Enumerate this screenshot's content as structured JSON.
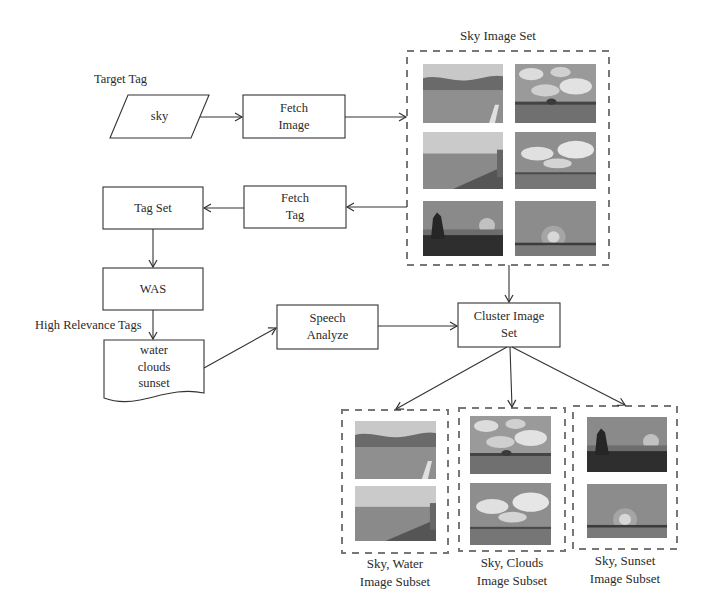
{
  "labels": {
    "target_tag": "Target Tag",
    "sky_image_set": "Sky Image Set",
    "high_relevance_tags": "High Relevance Tags"
  },
  "nodes": {
    "sky_input": {
      "text": "sky",
      "shape": "parallelogram"
    },
    "fetch_image": {
      "line1": "Fetch",
      "line2": "Image",
      "shape": "rectangle"
    },
    "fetch_tag": {
      "line1": "Fetch",
      "line2": "Tag",
      "shape": "rectangle"
    },
    "tag_set": {
      "text": "Tag Set",
      "shape": "rectangle"
    },
    "was": {
      "text": "WAS",
      "shape": "rectangle"
    },
    "tags_document": {
      "lines": [
        "water",
        "clouds",
        "sunset"
      ],
      "shape": "document"
    },
    "speech_analyze": {
      "line1": "Speech",
      "line2": "Analyze",
      "shape": "rectangle"
    },
    "cluster_image_set": {
      "line1": "Cluster Image",
      "line2": "Set",
      "shape": "rectangle"
    }
  },
  "image_sets": {
    "sky": {
      "images": [
        "lake-hills",
        "clouds-tree",
        "water-shore",
        "cumulus-field",
        "sunset-tree",
        "sunset-sun"
      ]
    }
  },
  "subsets": [
    {
      "id": "water",
      "line1": "Sky, Water",
      "line2": "Image Subset",
      "images": [
        "lake-hills",
        "water-shore"
      ]
    },
    {
      "id": "clouds",
      "line1": "Sky, Clouds",
      "line2": "Image Subset",
      "images": [
        "clouds-tree",
        "cumulus-field"
      ]
    },
    {
      "id": "sunset",
      "line1": "Sky, Sunset",
      "line2": "Image Subset",
      "images": [
        "sunset-tree",
        "sunset-sun"
      ]
    }
  ],
  "edges": [
    {
      "from": "sky_input",
      "to": "fetch_image"
    },
    {
      "from": "fetch_image",
      "to": "sky_image_set"
    },
    {
      "from": "sky_image_set",
      "to": "fetch_tag"
    },
    {
      "from": "fetch_tag",
      "to": "tag_set"
    },
    {
      "from": "tag_set",
      "to": "was"
    },
    {
      "from": "was",
      "to": "tags_document",
      "label": "High Relevance Tags"
    },
    {
      "from": "tags_document",
      "to": "speech_analyze"
    },
    {
      "from": "speech_analyze",
      "to": "cluster_image_set"
    },
    {
      "from": "sky_image_set",
      "to": "cluster_image_set"
    },
    {
      "from": "cluster_image_set",
      "to": "water_subset"
    },
    {
      "from": "cluster_image_set",
      "to": "clouds_subset"
    },
    {
      "from": "cluster_image_set",
      "to": "sunset_subset"
    }
  ],
  "colors": {
    "line": "#333333",
    "dash": "#777777",
    "background": "#ffffff"
  }
}
